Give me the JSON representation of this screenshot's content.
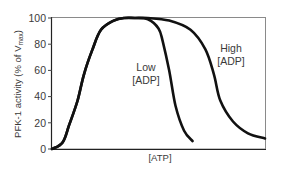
{
  "chart_data": {
    "type": "line",
    "title": "",
    "xlabel": "[ATP]",
    "ylabel": "PFK-1 activity (% of V_max)",
    "ylabel_parts": {
      "main": "PFK-1 activity (% of V",
      "sub": "max",
      "close": ")"
    },
    "ylim": [
      0,
      100
    ],
    "yticks": [
      0,
      20,
      40,
      60,
      80,
      100
    ],
    "xticks": [],
    "grid": false,
    "legend": "none (curves labeled inline)",
    "x_units": "relative [ATP] (no numeric ticks shown; 0 = axis origin, 100 = right edge)",
    "series": [
      {
        "name": "Low [ADP]",
        "label_lines": [
          "Low",
          "[ADP]"
        ],
        "x": [
          0,
          5,
          8,
          12,
          15,
          19,
          23,
          29,
          34,
          39,
          45,
          50,
          52,
          55,
          58,
          62,
          66
        ],
        "y": [
          0,
          5,
          18,
          37,
          57,
          76,
          91,
          98,
          100,
          100,
          99,
          92,
          82,
          60,
          33,
          14,
          6
        ]
      },
      {
        "name": "High [ADP]",
        "label_lines": [
          "High",
          "[ADP]"
        ],
        "x": [
          0,
          5,
          8,
          12,
          15,
          19,
          23,
          29,
          34,
          39,
          45,
          55,
          65,
          72,
          76,
          79,
          85,
          92,
          100
        ],
        "y": [
          0,
          5,
          18,
          37,
          57,
          76,
          91,
          98,
          100,
          100,
          100,
          98,
          91,
          76,
          57,
          37,
          21,
          12,
          8
        ]
      }
    ]
  }
}
